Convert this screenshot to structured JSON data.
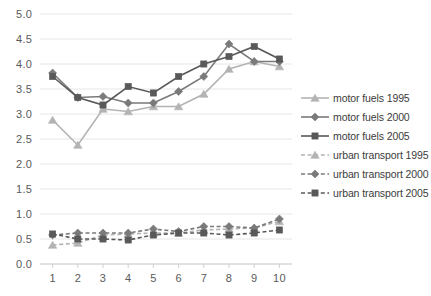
{
  "chart_data": {
    "type": "line",
    "title": "",
    "xlabel": "",
    "ylabel": "",
    "x": [
      1,
      2,
      3,
      4,
      5,
      6,
      7,
      8,
      9,
      10
    ],
    "xtick_labels": [
      "1",
      "2",
      "3",
      "4",
      "5",
      "6",
      "7",
      "8",
      "9",
      "10"
    ],
    "ytick_labels": [
      "0.0",
      "0.5",
      "1.0",
      "1.5",
      "2.0",
      "2.5",
      "3.0",
      "3.5",
      "4.0",
      "4.5",
      "5.0"
    ],
    "ylim": [
      0.0,
      5.0
    ],
    "ytick_step": 0.5,
    "xlim": [
      0.5,
      10.5
    ],
    "grid": "horizontal",
    "legend_position": "right",
    "series": [
      {
        "name": "motor fuels 1995",
        "marker": "triangle",
        "line": "solid",
        "color": "#b3b3b3",
        "values": [
          2.88,
          2.38,
          3.1,
          3.05,
          3.15,
          3.15,
          3.4,
          3.9,
          4.05,
          3.95
        ]
      },
      {
        "name": "motor fuels 2000",
        "marker": "diamond",
        "line": "solid",
        "color": "#7a7a7a",
        "values": [
          3.82,
          3.33,
          3.35,
          3.22,
          3.22,
          3.45,
          3.75,
          4.4,
          4.05,
          4.05
        ]
      },
      {
        "name": "motor fuels 2005",
        "marker": "square",
        "line": "solid",
        "color": "#595959",
        "values": [
          3.75,
          3.33,
          3.18,
          3.55,
          3.42,
          3.75,
          4.0,
          4.15,
          4.35,
          4.1
        ]
      },
      {
        "name": "urban transport 1995",
        "marker": "triangle",
        "line": "dashed",
        "color": "#b3b3b3",
        "values": [
          0.38,
          0.42,
          0.58,
          0.6,
          0.62,
          0.62,
          0.68,
          0.7,
          0.72,
          0.85
        ]
      },
      {
        "name": "urban transport 2000",
        "marker": "diamond",
        "line": "dashed",
        "color": "#7a7a7a",
        "values": [
          0.58,
          0.62,
          0.62,
          0.62,
          0.7,
          0.65,
          0.75,
          0.75,
          0.72,
          0.9
        ]
      },
      {
        "name": "urban transport 2005",
        "marker": "square",
        "line": "dashed",
        "color": "#595959",
        "values": [
          0.6,
          0.5,
          0.5,
          0.48,
          0.58,
          0.62,
          0.62,
          0.58,
          0.62,
          0.68
        ]
      }
    ]
  },
  "legend": {
    "items": [
      {
        "label": "motor fuels 1995"
      },
      {
        "label": "motor fuels 2000"
      },
      {
        "label": "motor fuels 2005"
      },
      {
        "label": "urban transport 1995"
      },
      {
        "label": "urban transport 2000"
      },
      {
        "label": "urban transport 2005"
      }
    ]
  },
  "colors": {
    "light_gray": "#b3b3b3",
    "mid_gray": "#7a7a7a",
    "dark_gray": "#595959",
    "grid": "#e6e6e6",
    "axis": "#d0d0d0",
    "text": "#5a5a5a"
  }
}
